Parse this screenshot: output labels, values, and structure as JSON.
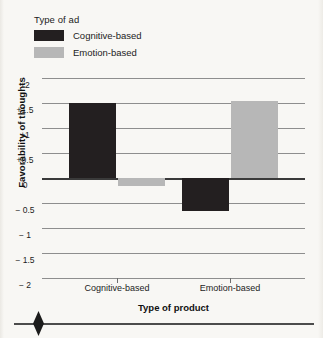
{
  "figure": {
    "background_color": "#f8f7f4"
  },
  "legend": {
    "title": "Type of ad",
    "items": [
      {
        "label": "Cognitive-based",
        "color": "#231f20",
        "swatch_name": "legend-swatch-cognitive"
      },
      {
        "label": "Emotion-based",
        "color": "#b7b7b7",
        "swatch_name": "legend-swatch-emotion"
      }
    ]
  },
  "axes": {
    "ylabel": "Favorability of thoughts",
    "xlabel": "Type of product",
    "ytick_labels": [
      "+2",
      "+1.5",
      "+1",
      "+0.5",
      "0",
      "− 0.5",
      "− 1",
      "− 1.5",
      "− 2"
    ],
    "xtick_labels": [
      "Cognitive-based",
      "Emotion-based"
    ]
  },
  "chart_data": {
    "type": "bar",
    "title": "",
    "xlabel": "Type of product",
    "ylabel": "Favorability of thoughts",
    "categories": [
      "Cognitive-based",
      "Emotion-based"
    ],
    "series": [
      {
        "name": "Cognitive-based",
        "color": "#231f20",
        "values": [
          1.5,
          -0.65
        ]
      },
      {
        "name": "Emotion-based",
        "color": "#b7b7b7",
        "values": [
          -0.15,
          1.55
        ]
      }
    ],
    "legend_title": "Type of ad",
    "legend_position": "top-left",
    "ylim": [
      -2,
      2
    ],
    "ytick_values": [
      2,
      1.5,
      1,
      0.5,
      0,
      -0.5,
      -1,
      -1.5,
      -2
    ],
    "ytick_labels": [
      "+2",
      "+1.5",
      "+1",
      "+0.5",
      "0",
      "− 0.5",
      "− 1",
      "− 1.5",
      "− 2"
    ],
    "grid": true,
    "zero_line": true
  },
  "footer": {
    "marker_name": "diamond-marker"
  }
}
